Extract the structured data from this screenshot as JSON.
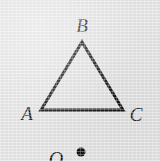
{
  "figure": {
    "kind": "geometry-diagram",
    "width": 160,
    "height": 161,
    "background_color": "#e4e4e4",
    "ink_color": "#141417"
  },
  "shape": {
    "name": "triangle",
    "stroke_color": "#141417",
    "stroke_width": 3,
    "fill": "none",
    "vertices": [
      {
        "label": "A",
        "x": 41,
        "y": 110
      },
      {
        "label": "B",
        "x": 82,
        "y": 42
      },
      {
        "label": "C",
        "x": 123,
        "y": 110
      }
    ]
  },
  "labels": {
    "a": "A",
    "b": "B",
    "c": "C",
    "o": "O"
  },
  "label_positions": {
    "a": {
      "x": 27,
      "y": 113
    },
    "b": {
      "x": 82,
      "y": 25
    },
    "c": {
      "x": 136,
      "y": 114
    },
    "o": {
      "x": 56,
      "y": 159
    }
  },
  "point_marker": {
    "name": "center-point-dot",
    "x": 81,
    "y": 152,
    "radius": 4.5,
    "fill": "#141417"
  }
}
